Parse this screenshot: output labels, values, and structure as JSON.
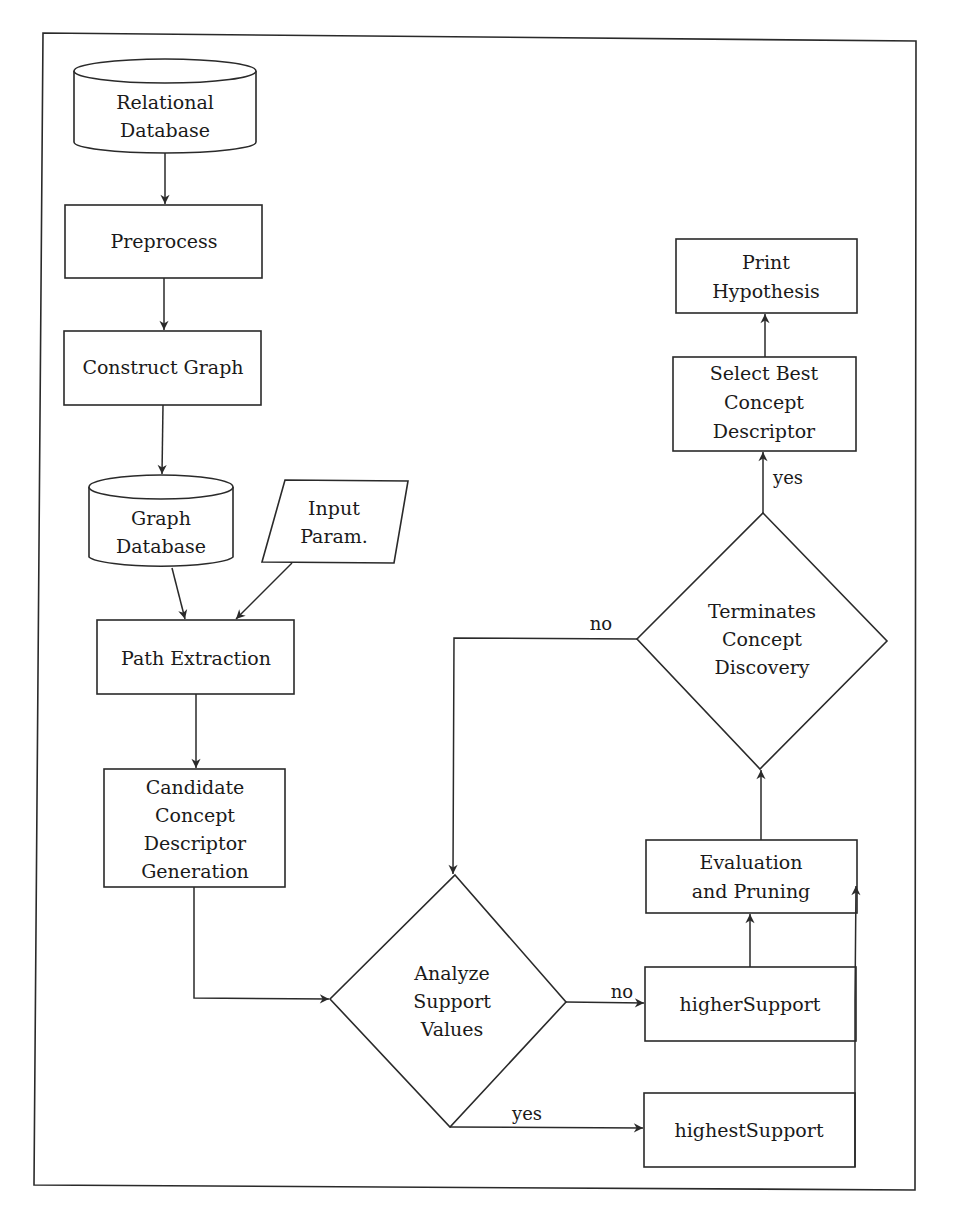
{
  "diagram": {
    "type": "flowchart",
    "nodes": {
      "relational_db": {
        "shape": "cylinder",
        "lines": [
          "Relational",
          "Database"
        ]
      },
      "preprocess": {
        "shape": "rectangle",
        "lines": [
          "Preprocess"
        ]
      },
      "construct_graph": {
        "shape": "rectangle",
        "lines": [
          "Construct Graph"
        ]
      },
      "graph_db": {
        "shape": "cylinder",
        "lines": [
          "Graph",
          "Database"
        ]
      },
      "input_param": {
        "shape": "parallelogram",
        "lines": [
          "Input",
          "Param."
        ]
      },
      "path_extraction": {
        "shape": "rectangle",
        "lines": [
          "Path Extraction"
        ]
      },
      "candidate": {
        "shape": "rectangle",
        "lines": [
          "Candidate",
          "Concept",
          "Descriptor",
          "Generation"
        ]
      },
      "analyze": {
        "shape": "diamond",
        "lines": [
          "Analyze",
          "Support",
          "Values"
        ]
      },
      "higher_support": {
        "shape": "rectangle",
        "lines": [
          "higherSupport"
        ]
      },
      "highest_support": {
        "shape": "rectangle",
        "lines": [
          "highestSupport"
        ]
      },
      "evaluation": {
        "shape": "rectangle",
        "lines": [
          "Evaluation",
          "and Pruning"
        ]
      },
      "terminates": {
        "shape": "diamond",
        "lines": [
          "Terminates",
          "Concept",
          "Discovery"
        ]
      },
      "select_best": {
        "shape": "rectangle",
        "lines": [
          "Select Best",
          "Concept",
          "Descriptor"
        ]
      },
      "print_hypothesis": {
        "shape": "rectangle",
        "lines": [
          "Print",
          "Hypothesis"
        ]
      }
    },
    "edges": [
      {
        "from": "relational_db",
        "to": "preprocess",
        "label": ""
      },
      {
        "from": "preprocess",
        "to": "construct_graph",
        "label": ""
      },
      {
        "from": "construct_graph",
        "to": "graph_db",
        "label": ""
      },
      {
        "from": "graph_db",
        "to": "path_extraction",
        "label": ""
      },
      {
        "from": "input_param",
        "to": "path_extraction",
        "label": ""
      },
      {
        "from": "path_extraction",
        "to": "candidate",
        "label": ""
      },
      {
        "from": "candidate",
        "to": "analyze",
        "label": ""
      },
      {
        "from": "analyze",
        "to": "higher_support",
        "label": "no"
      },
      {
        "from": "analyze",
        "to": "highest_support",
        "label": "yes"
      },
      {
        "from": "higher_support",
        "to": "evaluation",
        "label": ""
      },
      {
        "from": "highest_support",
        "to": "evaluation",
        "label": ""
      },
      {
        "from": "evaluation",
        "to": "terminates",
        "label": ""
      },
      {
        "from": "terminates",
        "to": "select_best",
        "label": "yes"
      },
      {
        "from": "terminates",
        "to": "analyze",
        "label": "no"
      },
      {
        "from": "select_best",
        "to": "print_hypothesis",
        "label": ""
      }
    ],
    "edge_labels": {
      "analyze_no": "no",
      "analyze_yes": "yes",
      "terminates_yes": "yes",
      "terminates_no": "no"
    }
  }
}
